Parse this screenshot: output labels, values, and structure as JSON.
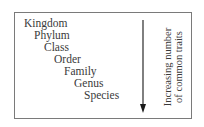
{
  "diagram": {
    "type": "taxonomic-hierarchy",
    "ranks": [
      {
        "label": "Kingdom",
        "level": 0
      },
      {
        "label": "Phylum",
        "level": 1
      },
      {
        "label": "Class",
        "level": 2
      },
      {
        "label": "Order",
        "level": 3
      },
      {
        "label": "Family",
        "level": 4
      },
      {
        "label": "Genus",
        "level": 5
      },
      {
        "label": "Species",
        "level": 6
      }
    ],
    "arrow": {
      "direction": "down",
      "label_line1": "Increasing number",
      "label_line2": "of common traits"
    },
    "colors": {
      "border": "#7a7a7a",
      "text": "#3a3a3a",
      "arrow": "#2a2a2a"
    }
  }
}
